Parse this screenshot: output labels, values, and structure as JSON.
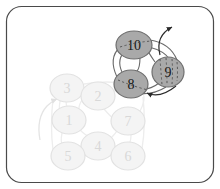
{
  "figure": {
    "title": "",
    "frame": {
      "stroke": "#4a4a4a",
      "fill": "#ffffff",
      "corner_radius": 14
    }
  },
  "palette": {
    "node_dim_fill": "#f4f4f4",
    "node_dim_stroke": "#e2e2e2",
    "node_dim_text": "#d6d6d6",
    "node_highlight_fill": "#a9a9a9",
    "node_highlight_stroke": "#6f6f6f",
    "node_highlight_text": "#1a1a1a",
    "edge_dim": "#ededed",
    "edge_highlight": "#5e5e5e",
    "arrow_dim": "#e8e8e8",
    "arrow_highlight": "#2b2b2b"
  },
  "graph": {
    "type": "node-link-diagram",
    "node_shape": "ellipse",
    "node_rx": 17,
    "node_ry": 14,
    "nodes": [
      {
        "id": "1",
        "label": "1",
        "cx": 69,
        "cy": 120,
        "state": "dim"
      },
      {
        "id": "2",
        "label": "2",
        "cx": 98,
        "cy": 96,
        "state": "dim"
      },
      {
        "id": "3",
        "label": "3",
        "cx": 67,
        "cy": 88,
        "state": "dim"
      },
      {
        "id": "4",
        "label": "4",
        "cx": 98,
        "cy": 146,
        "state": "dim"
      },
      {
        "id": "5",
        "label": "5",
        "cx": 68,
        "cy": 156,
        "state": "dim"
      },
      {
        "id": "6",
        "label": "6",
        "cx": 128,
        "cy": 156,
        "state": "dim"
      },
      {
        "id": "7",
        "label": "7",
        "cx": 128,
        "cy": 121,
        "state": "dim"
      },
      {
        "id": "8",
        "label": "8",
        "cx": 131,
        "cy": 84,
        "state": "highlight"
      },
      {
        "id": "9",
        "label": "9",
        "cx": 168,
        "cy": 72,
        "state": "highlight"
      },
      {
        "id": "10",
        "label": "10",
        "cx": 134,
        "cy": 45,
        "state": "highlight"
      }
    ],
    "edges": [
      {
        "from": "3",
        "to": "2",
        "state": "dim"
      },
      {
        "from": "3",
        "to": "1",
        "state": "dim"
      },
      {
        "from": "2",
        "to": "1",
        "state": "dim"
      },
      {
        "from": "2",
        "to": "7",
        "state": "dim"
      },
      {
        "from": "1",
        "to": "4",
        "state": "dim"
      },
      {
        "from": "1",
        "to": "5",
        "state": "dim"
      },
      {
        "from": "4",
        "to": "7",
        "state": "dim"
      },
      {
        "from": "4",
        "to": "5",
        "state": "dim"
      },
      {
        "from": "4",
        "to": "6",
        "state": "dim"
      },
      {
        "from": "7",
        "to": "6",
        "state": "dim"
      },
      {
        "from": "2",
        "to": "8",
        "state": "dim"
      },
      {
        "from": "7",
        "to": "8",
        "state": "dim"
      },
      {
        "from": "8",
        "to": "10",
        "state": "highlight"
      },
      {
        "from": "10",
        "to": "9",
        "state": "highlight"
      },
      {
        "from": "9",
        "to": "8",
        "state": "highlight"
      },
      {
        "from": "8",
        "to": "9",
        "state": "highlight"
      },
      {
        "from": "10",
        "to": "8",
        "state": "highlight"
      }
    ],
    "arrows": [
      {
        "name": "incoming-arrow-node-3",
        "state": "dim"
      },
      {
        "name": "incoming-arrow-node-8",
        "state": "highlight"
      },
      {
        "name": "outgoing-arrow-node-9",
        "state": "highlight"
      }
    ],
    "highlighted_cluster": [
      "8",
      "9",
      "10"
    ],
    "dim_cluster": [
      "1",
      "2",
      "3",
      "4",
      "5",
      "6",
      "7"
    ]
  }
}
